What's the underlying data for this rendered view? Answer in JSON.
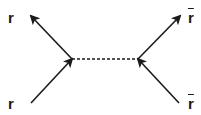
{
  "diagram": {
    "type": "feynman-diagram",
    "labels": {
      "top_left": "r",
      "bottom_left": "r",
      "top_right": "r",
      "bottom_right": "r"
    },
    "antiparticle_labels": [
      "top_right",
      "bottom_right"
    ],
    "vertices": [
      {
        "id": "left",
        "x": 72,
        "y": 59
      },
      {
        "id": "right",
        "x": 138,
        "y": 59
      }
    ],
    "lines": [
      {
        "id": "incoming-bottom-left",
        "from": [
          31,
          103
        ],
        "to": [
          72,
          59
        ],
        "arrow": "mid-toward-vertex",
        "style": "solid"
      },
      {
        "id": "outgoing-top-left",
        "from": [
          72,
          59
        ],
        "to": [
          31,
          16
        ],
        "arrow": "end",
        "style": "solid"
      },
      {
        "id": "propagator",
        "from": [
          72,
          59
        ],
        "to": [
          138,
          59
        ],
        "arrow": "none",
        "style": "dashed"
      },
      {
        "id": "incoming-bottom-right",
        "from": [
          179,
          103
        ],
        "to": [
          138,
          59
        ],
        "arrow": "mid-toward-vertex",
        "style": "solid"
      },
      {
        "id": "outgoing-top-right",
        "from": [
          138,
          59
        ],
        "to": [
          180,
          16
        ],
        "arrow": "end",
        "style": "solid"
      }
    ],
    "colors": {
      "line": "#1a1a1a",
      "background": "#ffffff"
    }
  }
}
